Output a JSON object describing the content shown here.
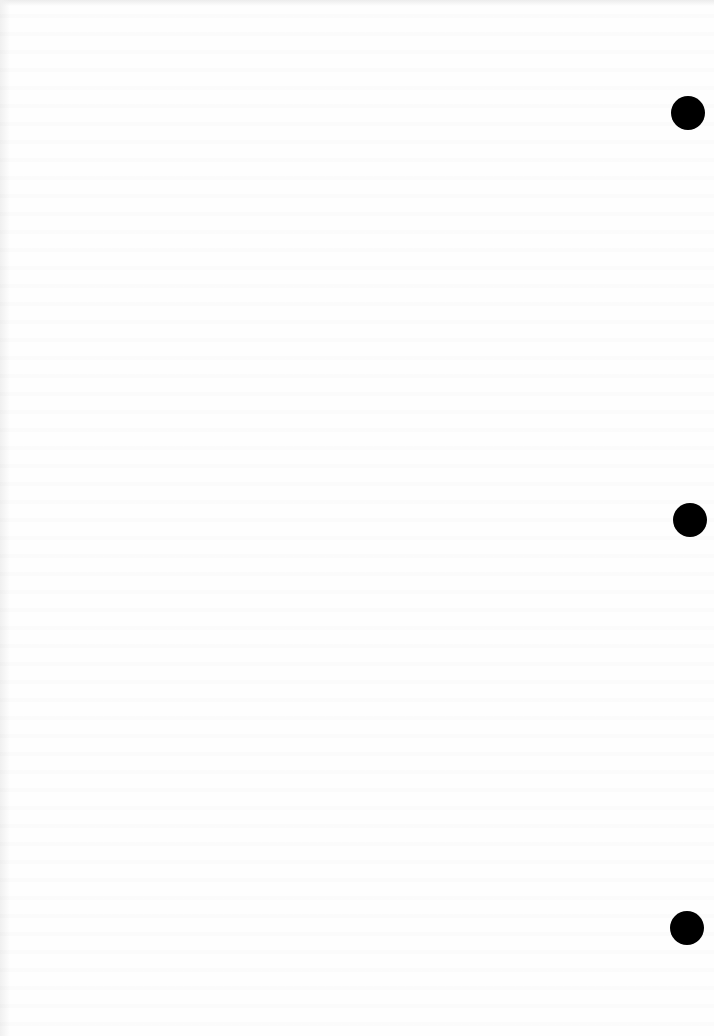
{
  "document": {
    "type": "blank scanned page",
    "background_color": "#fefefe",
    "text_content": ""
  },
  "punch_holes": [
    {
      "cx": 688,
      "cy": 113,
      "r": 17,
      "color": "#000000"
    },
    {
      "cx": 690,
      "cy": 520,
      "r": 17,
      "color": "#000000"
    },
    {
      "cx": 687,
      "cy": 928,
      "r": 17,
      "color": "#000000"
    }
  ]
}
